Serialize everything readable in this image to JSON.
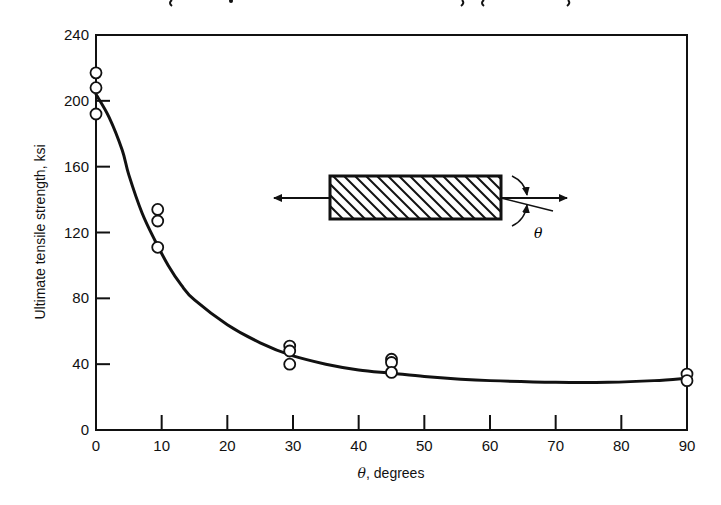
{
  "chart_data": {
    "type": "scatter",
    "title": "",
    "xlabel": "θ, degrees",
    "xlabel_symbol": "θ",
    "xlabel_rest": ", degrees",
    "ylabel": "Ultimate tensile strength, ksi",
    "xlim": [
      0,
      90
    ],
    "ylim": [
      0,
      240
    ],
    "x_ticks": [
      0,
      10,
      20,
      30,
      40,
      50,
      60,
      70,
      80,
      90
    ],
    "y_ticks": [
      0,
      40,
      80,
      120,
      160,
      200,
      240
    ],
    "grid": false,
    "legend": null,
    "series": [
      {
        "name": "Measured data",
        "kind": "scatter",
        "marker": "open-circle",
        "points": [
          [
            0,
            217
          ],
          [
            0,
            208
          ],
          [
            0,
            192
          ],
          [
            9.4,
            134
          ],
          [
            9.4,
            127
          ],
          [
            9.4,
            111
          ],
          [
            29.5,
            51
          ],
          [
            29.5,
            48
          ],
          [
            29.5,
            40
          ],
          [
            45,
            43
          ],
          [
            45,
            41
          ],
          [
            45,
            35
          ],
          [
            90,
            34
          ],
          [
            90,
            30
          ]
        ]
      },
      {
        "name": "Fitted curve",
        "kind": "line",
        "points": [
          [
            0,
            204
          ],
          [
            2,
            190
          ],
          [
            4,
            170
          ],
          [
            5,
            155
          ],
          [
            7,
            132
          ],
          [
            9,
            115
          ],
          [
            11,
            100
          ],
          [
            13,
            88
          ],
          [
            15,
            79
          ],
          [
            20,
            64
          ],
          [
            25,
            53
          ],
          [
            30,
            45
          ],
          [
            35,
            40
          ],
          [
            40,
            36.5
          ],
          [
            45,
            34.5
          ],
          [
            50,
            32.5
          ],
          [
            55,
            31
          ],
          [
            60,
            30
          ],
          [
            70,
            29
          ],
          [
            78,
            29
          ],
          [
            85,
            30
          ],
          [
            90,
            31.5
          ]
        ]
      }
    ],
    "annotations": [
      {
        "type": "inset-diagram",
        "description": "Hatched unidirectional composite specimen under tension; fiber angle θ measured from loading axis",
        "label": "θ"
      }
    ]
  },
  "inset": {
    "angle_label": "θ"
  }
}
